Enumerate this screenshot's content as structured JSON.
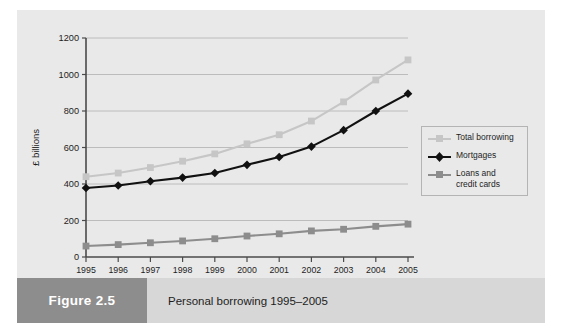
{
  "figure": {
    "number": "Figure 2.5",
    "title": "Personal borrowing 1995–2005"
  },
  "legend": {
    "entries": [
      {
        "label": "Total borrowing",
        "color": "#c6c6c6",
        "marker": "square-marker-icon"
      },
      {
        "label": "Mortgages",
        "color": "#111111",
        "marker": "diamond-marker-icon"
      },
      {
        "label": "Loans and credit cards",
        "line1": "Loans and",
        "line2": "credit cards",
        "color": "#8d8d8d",
        "marker": "square-marker-icon"
      }
    ]
  },
  "chart_data": {
    "type": "line",
    "title": "Personal borrowing 1995–2005",
    "xlabel": "",
    "ylabel": "£ billions",
    "categories": [
      "1995",
      "1996",
      "1997",
      "1998",
      "1999",
      "2000",
      "2001",
      "2002",
      "2003",
      "2004",
      "2005"
    ],
    "x": [
      1995,
      1996,
      1997,
      1998,
      1999,
      2000,
      2001,
      2002,
      2003,
      2004,
      2005
    ],
    "ylim": [
      0,
      1200
    ],
    "yticks": [
      0,
      200,
      400,
      600,
      800,
      1000,
      1200
    ],
    "ytick_labels": [
      "0",
      "200",
      "400",
      "600",
      "800",
      "1000",
      "1200"
    ],
    "grid": true,
    "grid_axis": "y",
    "legend_position": "right",
    "series": [
      {
        "name": "Total borrowing",
        "color": "#c6c6c6",
        "marker": "square",
        "values": [
          440,
          460,
          490,
          525,
          565,
          620,
          670,
          745,
          850,
          970,
          1080
        ]
      },
      {
        "name": "Mortgages",
        "color": "#111111",
        "marker": "diamond",
        "values": [
          378,
          392,
          415,
          435,
          460,
          505,
          548,
          605,
          695,
          800,
          895
        ]
      },
      {
        "name": "Loans and credit cards",
        "color": "#8d8d8d",
        "marker": "square",
        "values": [
          60,
          68,
          78,
          88,
          100,
          115,
          127,
          143,
          152,
          168,
          180
        ]
      }
    ]
  },
  "colors": {
    "panel_background": "#e9e9e9",
    "axis": "#4a4a4a",
    "gridline": "#b0b0b0",
    "caption_number_background": "#8d8d8d",
    "caption_title_background": "#d7d7d7"
  }
}
